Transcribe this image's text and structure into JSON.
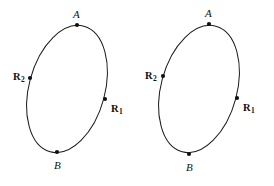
{
  "figure": {
    "background_color": "#ffffff",
    "stroke_color": "#1a1a1a",
    "marker_color": "#111111",
    "diagrams": [
      {
        "id": "left-ellipse",
        "ellipse": {
          "center_x": 67,
          "center_y": 89,
          "radius_x": 38,
          "radius_y": 65,
          "rotation_deg": 15
        },
        "points": [
          {
            "id": "A",
            "label": "A",
            "subscript": "",
            "style": "italic",
            "marker_x": 77,
            "marker_y": 25,
            "label_x": 73,
            "label_y": 9
          },
          {
            "id": "R2",
            "label": "R",
            "subscript": "2",
            "style": "bold",
            "marker_x": 30,
            "marker_y": 78,
            "label_x": 13,
            "label_y": 72
          },
          {
            "id": "R1",
            "label": "R",
            "subscript": "1",
            "style": "bold",
            "marker_x": 105,
            "marker_y": 99,
            "label_x": 111,
            "label_y": 104
          },
          {
            "id": "B",
            "label": "B",
            "subscript": "",
            "style": "italic",
            "marker_x": 57,
            "marker_y": 152,
            "label_x": 54,
            "label_y": 160
          }
        ]
      },
      {
        "id": "right-ellipse",
        "ellipse": {
          "center_x": 199,
          "center_y": 89,
          "radius_x": 38,
          "radius_y": 65,
          "rotation_deg": 15
        },
        "points": [
          {
            "id": "A",
            "label": "A",
            "subscript": "",
            "style": "italic",
            "marker_x": 209,
            "marker_y": 24,
            "label_x": 205,
            "label_y": 8
          },
          {
            "id": "R2",
            "label": "R",
            "subscript": "2",
            "style": "bold",
            "marker_x": 163,
            "marker_y": 76,
            "label_x": 145,
            "label_y": 71
          },
          {
            "id": "R1",
            "label": "R",
            "subscript": "1",
            "style": "bold",
            "marker_x": 237,
            "marker_y": 98,
            "label_x": 243,
            "label_y": 103
          },
          {
            "id": "B",
            "label": "B",
            "subscript": "",
            "style": "italic",
            "marker_x": 189,
            "marker_y": 154,
            "label_x": 186,
            "label_y": 162
          }
        ]
      }
    ]
  }
}
